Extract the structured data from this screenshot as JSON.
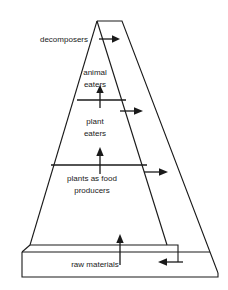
{
  "diagram": {
    "type": "ecological-pyramid",
    "colors": {
      "stroke": "#1a1a1a",
      "text": "#1a1a1a",
      "background": "#ffffff"
    },
    "levels": [
      {
        "id": "decomposers",
        "label": "decomposers",
        "label_line_1": "decomposers",
        "position": "outside-left-top"
      },
      {
        "id": "animal-eaters",
        "label": "animal eaters",
        "label_line_1": "animal",
        "label_line_2": "eaters",
        "position": "pyramid-level-1"
      },
      {
        "id": "plant-eaters",
        "label": "plant eaters",
        "label_line_1": "plant",
        "label_line_2": "eaters",
        "position": "pyramid-level-2"
      },
      {
        "id": "plants-as-food-producers",
        "label": "plants as food producers",
        "label_line_1": "plants as food",
        "label_line_2": "producers",
        "position": "pyramid-level-3"
      },
      {
        "id": "raw-materials",
        "label": "raw materials",
        "label_line_1": "raw materials",
        "position": "base-bar"
      }
    ],
    "arrows": [
      {
        "id": "arrow-into-decomposers-top",
        "direction": "right",
        "from": "apex-level",
        "to": "decomposer-channel"
      },
      {
        "id": "arrow-up-plant-to-animal",
        "direction": "up",
        "from": "plant eaters",
        "to": "animal eaters"
      },
      {
        "id": "arrow-into-decomposers-animal",
        "direction": "right",
        "from": "animal eaters",
        "to": "decomposer-channel"
      },
      {
        "id": "arrow-up-producers-to-plant",
        "direction": "up",
        "from": "plants as food producers",
        "to": "plant eaters"
      },
      {
        "id": "arrow-into-decomposers-producers",
        "direction": "right",
        "from": "plants as food producers",
        "to": "decomposer-channel"
      },
      {
        "id": "arrow-up-raw-to-producers",
        "direction": "up",
        "from": "raw materials",
        "to": "plants as food producers"
      },
      {
        "id": "arrow-return-to-raw-materials",
        "direction": "left",
        "from": "decomposer-channel",
        "to": "raw materials"
      }
    ]
  }
}
